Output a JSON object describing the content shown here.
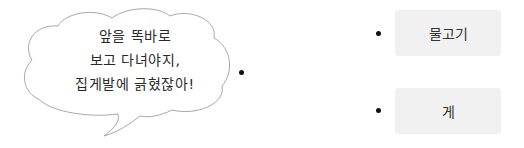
{
  "speech_bubble": {
    "lines": [
      "앞을 똑바로",
      "보고 다녀야지,",
      "집게발에 긁혔잖아!"
    ]
  },
  "options": [
    {
      "label": "물고기"
    },
    {
      "label": "게"
    }
  ],
  "colors": {
    "bubble_stroke": "#a8a8a8",
    "box_fill": "#f1f1f1",
    "dot": "#111111",
    "text": "#2a2a2a"
  }
}
